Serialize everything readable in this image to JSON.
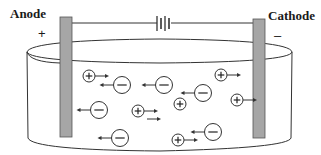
{
  "diagram": {
    "type": "electrolysis-cell",
    "labels": {
      "anode": "Anode",
      "cathode": "Cathode",
      "anode_sign": "+",
      "cathode_sign": "–"
    },
    "colors": {
      "electrode_fill": "#a6a6a6",
      "electrode_stroke": "#555555",
      "line": "#333333",
      "background": "#ffffff"
    },
    "battery": {
      "plates": 3
    },
    "ions": [
      {
        "charge": "+",
        "x": 89,
        "y": 76,
        "arrow": "right"
      },
      {
        "charge": "-",
        "x": 122,
        "y": 85,
        "arrow": "left"
      },
      {
        "charge": "-",
        "x": 164,
        "y": 85,
        "arrow": "left"
      },
      {
        "charge": "+",
        "x": 221,
        "y": 75,
        "arrow": "right"
      },
      {
        "charge": "-",
        "x": 203,
        "y": 93,
        "arrow": "left"
      },
      {
        "charge": "+",
        "x": 180,
        "y": 104,
        "arrow": "none"
      },
      {
        "charge": "+",
        "x": 237,
        "y": 100,
        "arrow": "right"
      },
      {
        "charge": "-",
        "x": 99,
        "y": 110,
        "arrow": "left"
      },
      {
        "charge": "+",
        "x": 138,
        "y": 111,
        "arrow": "right"
      },
      {
        "charge": "-",
        "x": 120,
        "y": 138,
        "arrow": "left"
      },
      {
        "charge": "-",
        "x": 213,
        "y": 132,
        "arrow": "left"
      },
      {
        "charge": "+",
        "x": 178,
        "y": 140,
        "arrow": "right"
      }
    ]
  }
}
